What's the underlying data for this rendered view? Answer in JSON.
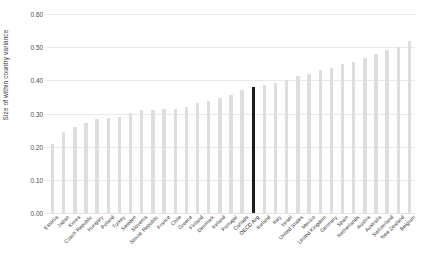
{
  "chart_data": {
    "type": "bar",
    "title": "",
    "subtitle": "",
    "xlabel": "",
    "ylabel": "Size of within country variance",
    "ylim": [
      0.0,
      0.6
    ],
    "ytick_labels": [
      "0.60",
      "0.50",
      "0.40",
      "0.30",
      "0.20",
      "0.10",
      "0.00"
    ],
    "ytick_values": [
      0.6,
      0.5,
      0.4,
      0.3,
      0.2,
      0.1,
      0.0
    ],
    "grid": "horizontal",
    "legend": "none",
    "bar_color": "#dedede",
    "highlight_color": "#1c1c1c",
    "highlight_category": "OECD Avg",
    "categories": [
      "Estonia",
      "Japan",
      "Korea",
      "Czech Republic",
      "Hungary",
      "Poland",
      "Turkey",
      "Sweden",
      "Slovenia",
      "Slovak Republic",
      "France",
      "Chile",
      "Greece",
      "Finland",
      "Denmark",
      "Ireland",
      "Portugal",
      "Canada",
      "OECD Avg",
      "Iceland",
      "Italy",
      "Israel",
      "United States",
      "Mexico",
      "United Kingdom",
      "Germany",
      "Spain",
      "Netherlands",
      "Austria",
      "Australia",
      "Switzerland",
      "New Zealand",
      "Belgium"
    ],
    "values": [
      0.208,
      0.245,
      0.258,
      0.272,
      0.282,
      0.287,
      0.288,
      0.302,
      0.31,
      0.312,
      0.313,
      0.315,
      0.32,
      0.333,
      0.337,
      0.348,
      0.356,
      0.372,
      0.38,
      0.385,
      0.392,
      0.4,
      0.412,
      0.42,
      0.43,
      0.438,
      0.448,
      0.455,
      0.468,
      0.478,
      0.49,
      0.502,
      0.518
    ]
  }
}
